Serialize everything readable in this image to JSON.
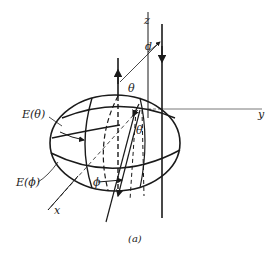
{
  "figure": {
    "caption": "(a)",
    "labels": {
      "z_axis": "z",
      "y_axis": "y",
      "x_axis": "x",
      "separation": "d",
      "theta_top": "θ",
      "theta_inner": "θ",
      "phi": "ϕ",
      "e_theta": "E(θ)",
      "e_phi": "E(ϕ)"
    },
    "colors": {
      "line": "#1a1a1a",
      "background": "#ffffff"
    }
  }
}
